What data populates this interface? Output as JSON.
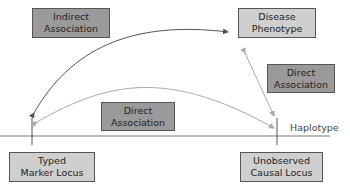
{
  "diagram": {
    "nodes": {
      "indirect": "Indirect Association",
      "disease": "Disease Phenotype",
      "direct_right": "Direct Association",
      "direct_middle": "Direct Association",
      "typed": "Typed Marker Locus",
      "causal": "Unobserved Causal Locus"
    },
    "nodes_lines": {
      "indirect": [
        "Indirect",
        "Association"
      ],
      "disease": [
        "Disease",
        "Phenotype"
      ],
      "direct_right": [
        "Direct",
        "Association"
      ],
      "direct_middle": [
        "Direct",
        "Association"
      ],
      "typed": [
        "Typed",
        "Marker Locus"
      ],
      "causal": [
        "Unobserved",
        "Causal Locus"
      ]
    },
    "haplotype_label": "Haplotype",
    "colors": {
      "light_box": "#cfcfcf",
      "dark_box": "#9a9a9a",
      "dark_arrow": "#555555",
      "light_arrow": "#aaaaaa"
    }
  }
}
